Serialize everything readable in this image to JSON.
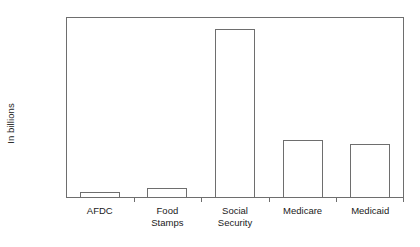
{
  "chart_data": {
    "type": "bar",
    "title": "",
    "xlabel": "",
    "ylabel": "In billions",
    "categories": [
      "AFDC",
      "Food Stamps",
      "Social Security",
      "Medicare",
      "Medicaid"
    ],
    "category_lines": [
      [
        "AFDC"
      ],
      [
        "Food",
        "Stamps"
      ],
      [
        "Social",
        "Security"
      ],
      [
        "Medicare"
      ],
      [
        "Medicaid"
      ]
    ],
    "values": [
      14,
      24,
      420,
      145,
      135
    ],
    "ylim": [
      0,
      450
    ],
    "yticks": [
      0,
      50,
      100,
      150,
      200,
      250,
      300,
      350,
      400,
      450
    ],
    "ytick_labels": [
      "0",
      "50",
      "100",
      "150",
      "200",
      "250",
      "300",
      "350",
      "400",
      "450"
    ],
    "grid": false,
    "legend": false,
    "bar_fill_color": "#ffffff",
    "bar_edge_color": "#6e6e6e",
    "axis_color": "#6e6e6e",
    "text_color": "#1a1a1a",
    "background_color": "#ffffff"
  }
}
